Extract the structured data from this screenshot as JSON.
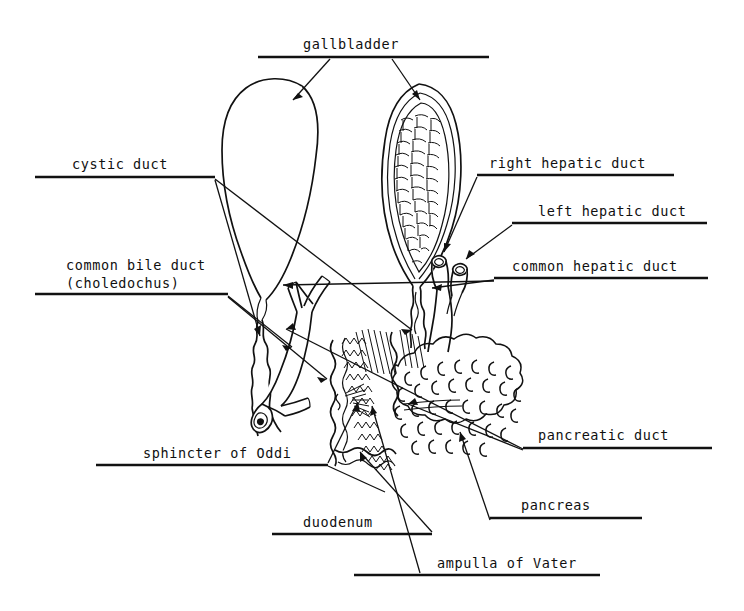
{
  "figure": {
    "background_color": "#ffffff",
    "ink_color": "#111111",
    "width": 744,
    "height": 611
  },
  "labels": {
    "gallbladder": "gallbladder",
    "cystic_duct": "cystic duct",
    "common_bile_duct_line1": "common bile duct",
    "common_bile_duct_line2": "(choledochus)",
    "right_hepatic_duct": "right hepatic duct",
    "left_hepatic_duct": "left hepatic duct",
    "common_hepatic_duct": "common hepatic duct",
    "pancreatic_duct": "pancreatic duct",
    "pancreas": "pancreas",
    "sphincter_of_oddi": "sphincter of Oddi",
    "duodenum": "duodenum",
    "ampulla_of_vater": "ampulla of Vater"
  }
}
